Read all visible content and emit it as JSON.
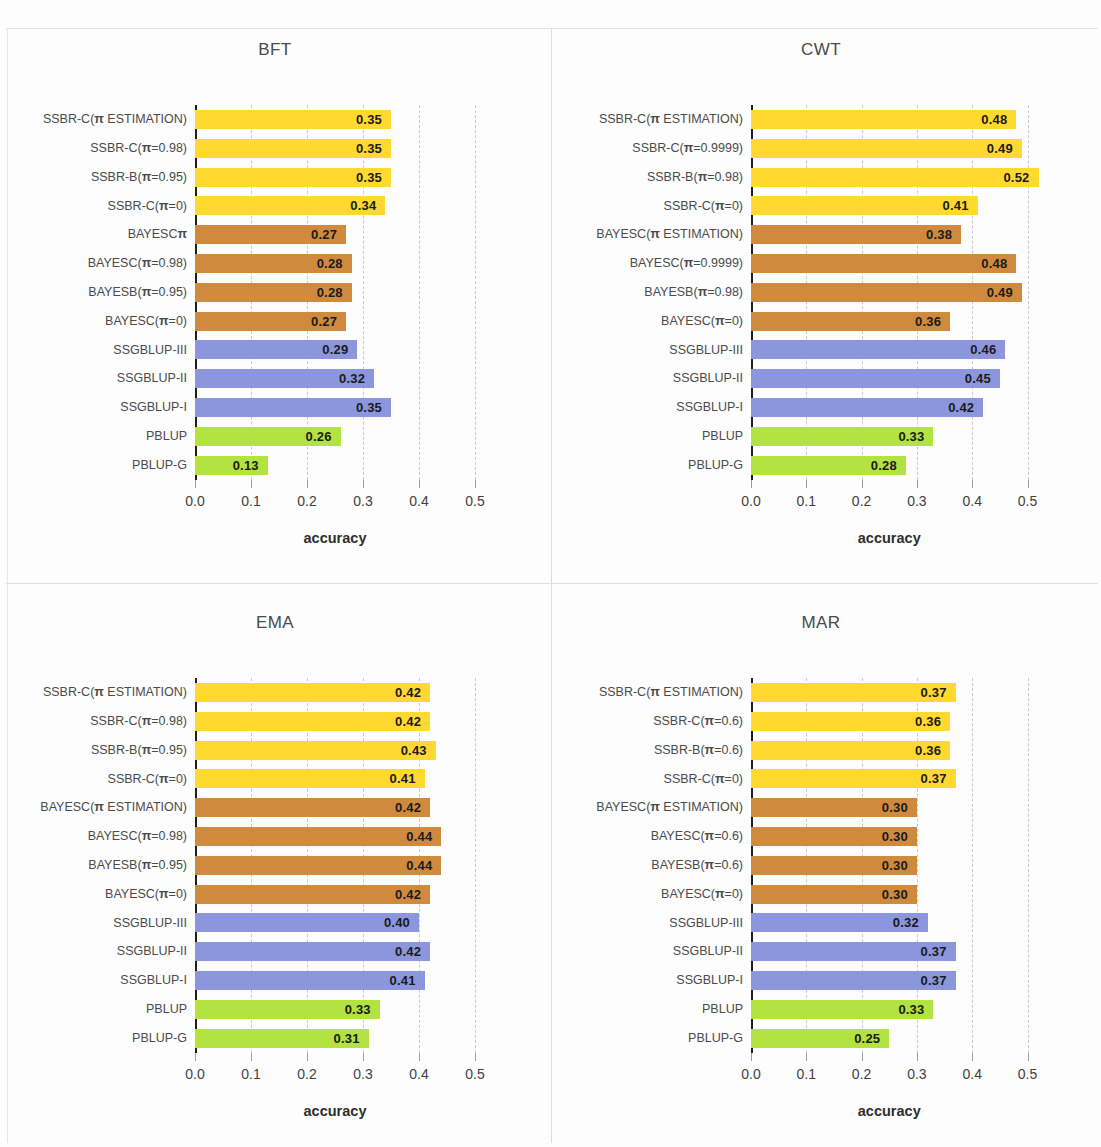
{
  "chart_data": [
    {
      "type": "bar",
      "title": "BFT",
      "xlabel": "accuracy",
      "ylabel": "",
      "xlim": [
        0.0,
        0.5
      ],
      "xticks": [
        "0.0",
        "0.1",
        "0.2",
        "0.3",
        "0.4",
        "0.5"
      ],
      "orientation": "horizontal",
      "grid": true,
      "legend": "none",
      "categories": [
        "SSBR-C(π ESTIMATION)",
        "SSBR-C(π=0.98)",
        "SSBR-B(π=0.95)",
        "SSBR-C(π=0)",
        "BAYESCπ",
        "BAYESC(π=0.98)",
        "BAYESB(π=0.95)",
        "BAYESC(π=0)",
        "SSGBLUP-III",
        "SSGBLUP-II",
        "SSGBLUP-I",
        "PBLUP",
        "PBLUP-G"
      ],
      "values": [
        0.35,
        0.35,
        0.35,
        0.34,
        0.27,
        0.28,
        0.28,
        0.27,
        0.29,
        0.32,
        0.35,
        0.26,
        0.13
      ],
      "labels": [
        "0.35",
        "0.35",
        "0.35",
        "0.34",
        "0.27",
        "0.28",
        "0.28",
        "0.27",
        "0.29",
        "0.32",
        "0.35",
        "0.26",
        "0.13"
      ],
      "colors": [
        "#FFD92F",
        "#FFD92F",
        "#FFD92F",
        "#FFD92F",
        "#D08A3E",
        "#D08A3E",
        "#D08A3E",
        "#D08A3E",
        "#8C96DD",
        "#8C96DD",
        "#8C96DD",
        "#B2E340",
        "#B2E340"
      ]
    },
    {
      "type": "bar",
      "title": "CWT",
      "xlabel": "accuracy",
      "ylabel": "",
      "xlim": [
        0.0,
        0.5
      ],
      "xticks": [
        "0.0",
        "0.1",
        "0.2",
        "0.3",
        "0.4",
        "0.5"
      ],
      "orientation": "horizontal",
      "grid": true,
      "legend": "none",
      "categories": [
        "SSBR-C(π ESTIMATION)",
        "SSBR-C(π=0.9999)",
        "SSBR-B(π=0.98)",
        "SSBR-C(π=0)",
        "BAYESC(π ESTIMATION)",
        "BAYESC(π=0.9999)",
        "BAYESB(π=0.98)",
        "BAYESC(π=0)",
        "SSGBLUP-III",
        "SSGBLUP-II",
        "SSGBLUP-I",
        "PBLUP",
        "PBLUP-G"
      ],
      "values": [
        0.48,
        0.49,
        0.52,
        0.41,
        0.38,
        0.48,
        0.49,
        0.36,
        0.46,
        0.45,
        0.42,
        0.33,
        0.28
      ],
      "labels": [
        "0.48",
        "0.49",
        "0.52",
        "0.41",
        "0.38",
        "0.48",
        "0.49",
        "0.36",
        "0.46",
        "0.45",
        "0.42",
        "0.33",
        "0.28"
      ],
      "colors": [
        "#FFD92F",
        "#FFD92F",
        "#FFD92F",
        "#FFD92F",
        "#D08A3E",
        "#D08A3E",
        "#D08A3E",
        "#D08A3E",
        "#8C96DD",
        "#8C96DD",
        "#8C96DD",
        "#B2E340",
        "#B2E340"
      ]
    },
    {
      "type": "bar",
      "title": "EMA",
      "xlabel": "accuracy",
      "ylabel": "",
      "xlim": [
        0.0,
        0.5
      ],
      "xticks": [
        "0.0",
        "0.1",
        "0.2",
        "0.3",
        "0.4",
        "0.5"
      ],
      "orientation": "horizontal",
      "grid": true,
      "legend": "none",
      "categories": [
        "SSBR-C(π ESTIMATION)",
        "SSBR-C(π=0.98)",
        "SSBR-B(π=0.95)",
        "SSBR-C(π=0)",
        "BAYESC(π ESTIMATION)",
        "BAYESC(π=0.98)",
        "BAYESB(π=0.95)",
        "BAYESC(π=0)",
        "SSGBLUP-III",
        "SSGBLUP-II",
        "SSGBLUP-I",
        "PBLUP",
        "PBLUP-G"
      ],
      "values": [
        0.42,
        0.42,
        0.43,
        0.41,
        0.42,
        0.44,
        0.44,
        0.42,
        0.4,
        0.42,
        0.41,
        0.33,
        0.31
      ],
      "labels": [
        "0.42",
        "0.42",
        "0.43",
        "0.41",
        "0.42",
        "0.44",
        "0.44",
        "0.42",
        "0.40",
        "0.42",
        "0.41",
        "0.33",
        "0.31"
      ],
      "colors": [
        "#FFD92F",
        "#FFD92F",
        "#FFD92F",
        "#FFD92F",
        "#D08A3E",
        "#D08A3E",
        "#D08A3E",
        "#D08A3E",
        "#8C96DD",
        "#8C96DD",
        "#8C96DD",
        "#B2E340",
        "#B2E340"
      ]
    },
    {
      "type": "bar",
      "title": "MAR",
      "xlabel": "accuracy",
      "ylabel": "",
      "xlim": [
        0.0,
        0.5
      ],
      "xticks": [
        "0.0",
        "0.1",
        "0.2",
        "0.3",
        "0.4",
        "0.5"
      ],
      "orientation": "horizontal",
      "grid": true,
      "legend": "none",
      "categories": [
        "SSBR-C(π ESTIMATION)",
        "SSBR-C(π=0.6)",
        "SSBR-B(π=0.6)",
        "SSBR-C(π=0)",
        "BAYESC(π ESTIMATION)",
        "BAYESC(π=0.6)",
        "BAYESB(π=0.6)",
        "BAYESC(π=0)",
        "SSGBLUP-III",
        "SSGBLUP-II",
        "SSGBLUP-I",
        "PBLUP",
        "PBLUP-G"
      ],
      "values": [
        0.37,
        0.36,
        0.36,
        0.37,
        0.3,
        0.3,
        0.3,
        0.3,
        0.32,
        0.37,
        0.37,
        0.33,
        0.25
      ],
      "labels": [
        "0.37",
        "0.36",
        "0.36",
        "0.37",
        "0.30",
        "0.30",
        "0.30",
        "0.30",
        "0.32",
        "0.37",
        "0.37",
        "0.33",
        "0.25"
      ],
      "colors": [
        "#FFD92F",
        "#FFD92F",
        "#FFD92F",
        "#FFD92F",
        "#D08A3E",
        "#D08A3E",
        "#D08A3E",
        "#D08A3E",
        "#8C96DD",
        "#8C96DD",
        "#8C96DD",
        "#B2E340",
        "#B2E340"
      ]
    }
  ]
}
